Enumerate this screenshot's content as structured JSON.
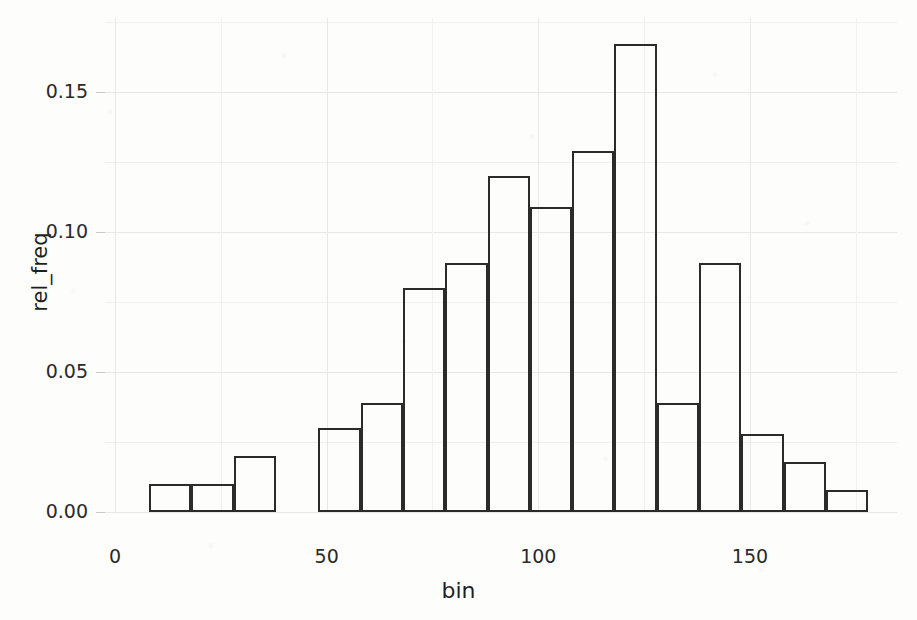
{
  "chart_data": {
    "type": "bar",
    "title": "",
    "subtitle": "",
    "xlabel": "bin",
    "ylabel": "rel_freq",
    "xlim": [
      0,
      180
    ],
    "ylim": [
      0.0,
      0.175
    ],
    "grid": true,
    "legend": false,
    "bar_style": "outlined-hollow",
    "bin_width": 10,
    "x_tick_labels": [
      "0",
      "50",
      "100",
      "150"
    ],
    "x_ticks": [
      0,
      50,
      100,
      150
    ],
    "y_tick_labels": [
      "0.00",
      "0.05",
      "0.10",
      "0.15"
    ],
    "y_ticks": [
      0.0,
      0.05,
      0.1,
      0.15
    ],
    "categories": [
      8,
      18,
      28,
      38,
      48,
      58,
      68,
      78,
      88,
      98,
      108,
      118,
      128,
      138,
      148,
      158,
      168
    ],
    "bin_edges": [
      8,
      18,
      28,
      38,
      48,
      58,
      68,
      78,
      88,
      98,
      108,
      118,
      128,
      138,
      148,
      158,
      168,
      178
    ],
    "values": [
      0.01,
      0.01,
      0.02,
      0.0,
      0.03,
      0.039,
      0.08,
      0.089,
      0.12,
      0.109,
      0.129,
      0.167,
      0.039,
      0.089,
      0.028,
      0.018,
      0.008
    ],
    "bars": [
      {
        "bin_start": 8,
        "bin_end": 18,
        "value": 0.01
      },
      {
        "bin_start": 18,
        "bin_end": 28,
        "value": 0.01
      },
      {
        "bin_start": 28,
        "bin_end": 38,
        "value": 0.02
      },
      {
        "bin_start": 38,
        "bin_end": 48,
        "value": 0.0
      },
      {
        "bin_start": 48,
        "bin_end": 58,
        "value": 0.03
      },
      {
        "bin_start": 58,
        "bin_end": 68,
        "value": 0.039
      },
      {
        "bin_start": 68,
        "bin_end": 78,
        "value": 0.08
      },
      {
        "bin_start": 78,
        "bin_end": 88,
        "value": 0.089
      },
      {
        "bin_start": 88,
        "bin_end": 98,
        "value": 0.12
      },
      {
        "bin_start": 98,
        "bin_end": 108,
        "value": 0.109
      },
      {
        "bin_start": 108,
        "bin_end": 118,
        "value": 0.129
      },
      {
        "bin_start": 118,
        "bin_end": 128,
        "value": 0.167
      },
      {
        "bin_start": 128,
        "bin_end": 138,
        "value": 0.039
      },
      {
        "bin_start": 138,
        "bin_end": 148,
        "value": 0.089
      },
      {
        "bin_start": 148,
        "bin_end": 158,
        "value": 0.028
      },
      {
        "bin_start": 158,
        "bin_end": 168,
        "value": 0.018
      },
      {
        "bin_start": 168,
        "bin_end": 178,
        "value": 0.008
      }
    ],
    "colors": {
      "bar_outline": "#2b2b2b",
      "bar_fill": "transparent",
      "grid_major": "#e8e8e6",
      "grid_minor": "#f1f1ef",
      "text": "#2a2a2a",
      "background": "#fdfdfb"
    }
  }
}
